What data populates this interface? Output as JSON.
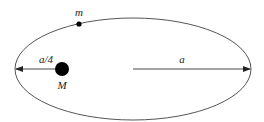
{
  "diagram": {
    "type": "elliptical-orbit",
    "labels": {
      "small_mass": "m",
      "central_mass": "M",
      "short_distance": "a/4",
      "semi_major_axis": "a"
    },
    "colors": {
      "stroke": "#555555",
      "body": "#000000"
    }
  }
}
